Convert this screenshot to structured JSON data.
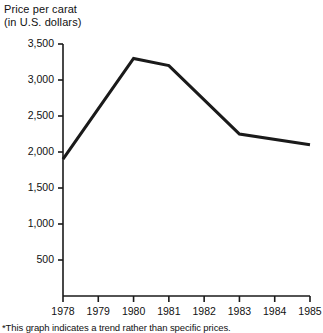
{
  "title": {
    "line1": "Price per carat",
    "line2": "(in U.S. dollars)"
  },
  "footnote": "*This graph indicates a trend rather than specific prices.",
  "colors": {
    "line": "#1a1a1a",
    "axis": "#1a1a1a",
    "background": "#ffffff",
    "text": "#111111"
  },
  "chart_data": {
    "type": "line",
    "title": "Price per carat (in U.S. dollars)",
    "xlabel": "",
    "ylabel": "Price per carat (in U.S. dollars)",
    "categories": [
      "1978",
      "1979",
      "1980",
      "1981",
      "1982",
      "1983",
      "1984",
      "1985"
    ],
    "x": [
      1978,
      1979,
      1980,
      1981,
      1982,
      1983,
      1984,
      1985
    ],
    "values": [
      1900,
      2600,
      3300,
      3200,
      2725,
      2250,
      2175,
      2100
    ],
    "vertices": [
      {
        "x": 1978,
        "y": 1900
      },
      {
        "x": 1980,
        "y": 3300
      },
      {
        "x": 1981,
        "y": 3200
      },
      {
        "x": 1983,
        "y": 2250
      },
      {
        "x": 1985,
        "y": 2100
      }
    ],
    "series": [
      {
        "name": "Price per carat",
        "values": [
          1900,
          2600,
          3300,
          3200,
          2725,
          2250,
          2175,
          2100
        ]
      }
    ],
    "ylim": [
      0,
      3500
    ],
    "xlim": [
      1978,
      1985
    ],
    "ytick_labels": [
      "500",
      "1,000",
      "1,500",
      "2,000",
      "2,500",
      "3,000",
      "3,500"
    ],
    "ytick_values": [
      500,
      1000,
      1500,
      2000,
      2500,
      3000,
      3500
    ],
    "xtick_labels": [
      "1978",
      "1979",
      "1980",
      "1981",
      "1982",
      "1983",
      "1984",
      "1985"
    ],
    "grid": false,
    "legend": false,
    "legend_position": "none",
    "annotations": [
      "*This graph indicates a trend rather than specific prices."
    ]
  }
}
